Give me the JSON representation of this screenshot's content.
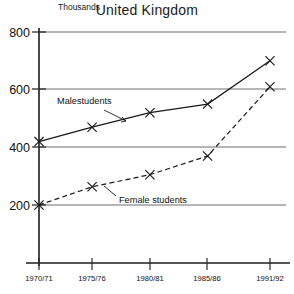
{
  "chart_data": {
    "type": "line",
    "title": "United Kingdom",
    "subtitle": "",
    "unit_label": "Thousands",
    "xlabel": "",
    "ylabel": "Thousands",
    "categories": [
      "1970/71",
      "1975/76",
      "1980/81",
      "1985/86",
      "1991/92"
    ],
    "x_positions_fraction": [
      0.0,
      0.23,
      0.48,
      0.73,
      1.0
    ],
    "ylim": [
      0,
      800
    ],
    "yticks": [
      200,
      400,
      600,
      800
    ],
    "ytick_labels": [
      "200",
      "400",
      "600",
      "800"
    ],
    "grid": true,
    "grid_axis": "y",
    "legend": "inline-annotations",
    "marker": "x",
    "series": [
      {
        "name": "Malestudents",
        "values": [
          420,
          470,
          520,
          550,
          700
        ],
        "style": "solid",
        "color": "#1a1a1a"
      },
      {
        "name": "Female students",
        "values": [
          200,
          263,
          305,
          370,
          610
        ],
        "style": "dashed",
        "color": "#1a1a1a"
      }
    ],
    "annotations": [
      {
        "text": "Malestudents",
        "x": 60,
        "y": 104
      },
      {
        "text": "Female students",
        "x": 118,
        "y": 200
      }
    ]
  },
  "chart": {
    "title": "United Kingdom",
    "unit_label": "Thousands",
    "ytick_labels": [
      "800",
      "600",
      "400",
      "200"
    ],
    "xtick_labels": [
      "1970/71",
      "1975/76",
      "1980/81",
      "1985/86",
      "1991/92"
    ],
    "series_labels": {
      "male": "Malestudents",
      "female": "Female students"
    }
  },
  "colors": {
    "ink": "#1a1a1a",
    "grid": "#6e6e6e",
    "background": "#ffffff"
  }
}
